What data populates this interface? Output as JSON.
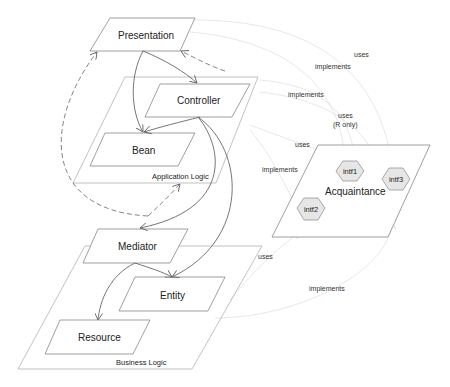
{
  "diagram": {
    "nodes": {
      "presentation": "Presentation",
      "controller": "Controller",
      "bean": "Bean",
      "mediator": "Mediator",
      "entity": "Entity",
      "resource": "Resource"
    },
    "containers": {
      "application_logic": "Application Logic",
      "business_logic": "Business Logic",
      "acquaintance": "Acquaintance"
    },
    "interfaces": [
      "intf1",
      "intf2",
      "intf3"
    ],
    "edge_labels": {
      "pres_uses": "uses",
      "pres_implements": "implements",
      "ctrl_implements": "implements",
      "ctrl_uses_r_line1": "uses",
      "ctrl_uses_r_line2": "(R only)",
      "app_uses": "uses",
      "app_implements": "implements",
      "bus_uses": "uses",
      "bus_implements": "implements"
    },
    "colors": {
      "hex_fill": "#e6e6e6",
      "line": "#777777"
    }
  }
}
